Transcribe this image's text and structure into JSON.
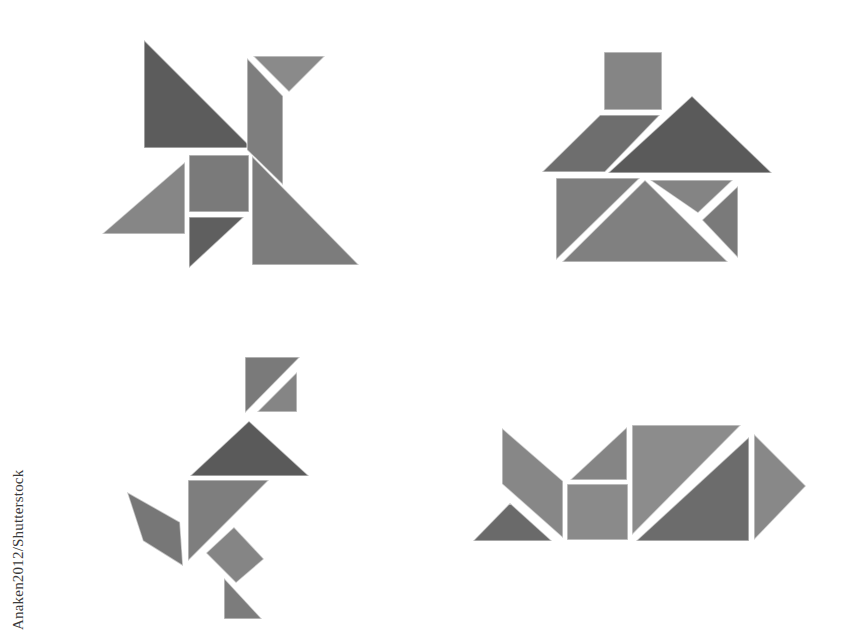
{
  "image": {
    "description": "Four tangram figures arranged on a white background: a pinwheel (top-left), a house (top-right), a running figure (bottom-left), and a fish (bottom-right).",
    "credit": "Anaken2012/Shutterstock",
    "background_color": "#ffffff",
    "tones": {
      "dark": "#5e5e5e",
      "medium": "#7a7a7a",
      "light": "#8e8e8e"
    },
    "figures": [
      {
        "name": "pinwheel",
        "pieces": 7
      },
      {
        "name": "house",
        "pieces": 7
      },
      {
        "name": "running-figure",
        "pieces": 7
      },
      {
        "name": "fish",
        "pieces": 7
      }
    ]
  }
}
